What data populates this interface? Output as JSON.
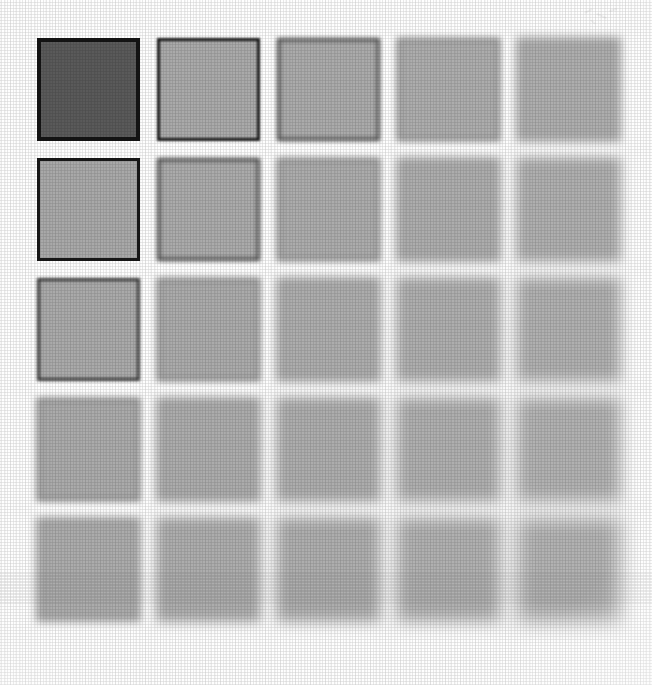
{
  "figure": {
    "background_color": "#fefefe",
    "image_width": 652,
    "image_height": 685,
    "rows": 5,
    "columns": 5,
    "cell_size": 103,
    "column_pitch": 120,
    "row_pitch": 120,
    "origin_x": 37,
    "origin_y": 38,
    "gap": 17,
    "border_color": "#1a1a1a",
    "dark_fill": "#5a5a5a",
    "light_fill": "#aaaaaa"
  },
  "chart_data": {
    "type": "heatmap",
    "xlabel": "Column",
    "ylabel": "Row",
    "categories_x": [
      "1",
      "2",
      "3",
      "4",
      "5"
    ],
    "categories_y": [
      "1",
      "2",
      "3",
      "4",
      "5"
    ],
    "grid": false,
    "legend": "none",
    "value_name": "blur_radius_px",
    "series": [
      {
        "name": "Row 1",
        "values": [
          0.0,
          0.8,
          2.0,
          3.4,
          4.6
        ]
      },
      {
        "name": "Row 2",
        "values": [
          0.6,
          2.0,
          3.4,
          4.6,
          5.8
        ]
      },
      {
        "name": "Row 3",
        "values": [
          1.8,
          3.2,
          4.6,
          5.8,
          7.0
        ]
      },
      {
        "name": "Row 4",
        "values": [
          3.2,
          4.6,
          5.8,
          7.0,
          8.2
        ]
      },
      {
        "name": "Row 5",
        "values": [
          4.4,
          5.8,
          7.0,
          8.2,
          9.4
        ]
      }
    ],
    "fill_series": [
      {
        "name": "Row 1",
        "values": [
          "#5a5a5a",
          "#aaaaaa",
          "#ababab",
          "#adadad",
          "#aeaeae"
        ]
      },
      {
        "name": "Row 2",
        "values": [
          "#a9a9a9",
          "#ababab",
          "#acacac",
          "#adadad",
          "#afafaf"
        ]
      },
      {
        "name": "Row 3",
        "values": [
          "#aaaaaa",
          "#ababab",
          "#adadad",
          "#aeaeae",
          "#b0b0b0"
        ]
      },
      {
        "name": "Row 4",
        "values": [
          "#ababab",
          "#acacac",
          "#adadad",
          "#afafaf",
          "#b1b1b1"
        ]
      },
      {
        "name": "Row 5",
        "values": [
          "#acacac",
          "#adadad",
          "#aeaeae",
          "#b0b0b0",
          "#b2b2b2"
        ]
      }
    ],
    "border_opacity_series": [
      {
        "name": "Row 1",
        "values": [
          1.0,
          0.96,
          0.72,
          0.5,
          0.38
        ]
      },
      {
        "name": "Row 2",
        "values": [
          0.97,
          0.74,
          0.52,
          0.39,
          0.3
        ]
      },
      {
        "name": "Row 3",
        "values": [
          0.76,
          0.54,
          0.4,
          0.31,
          0.24
        ]
      },
      {
        "name": "Row 4",
        "values": [
          0.55,
          0.41,
          0.32,
          0.25,
          0.19
        ]
      },
      {
        "name": "Row 5",
        "values": [
          0.42,
          0.33,
          0.26,
          0.2,
          0.15
        ]
      }
    ],
    "border_width_series": [
      {
        "name": "Row 1",
        "values": [
          4.0,
          3.6,
          3.0,
          2.6,
          2.4
        ]
      },
      {
        "name": "Row 2",
        "values": [
          3.6,
          3.0,
          2.6,
          2.4,
          2.2
        ]
      },
      {
        "name": "Row 3",
        "values": [
          3.0,
          2.6,
          2.4,
          2.2,
          2.0
        ]
      },
      {
        "name": "Row 4",
        "values": [
          2.6,
          2.4,
          2.2,
          2.0,
          2.0
        ]
      },
      {
        "name": "Row 5",
        "values": [
          2.4,
          2.2,
          2.0,
          2.0,
          2.0
        ]
      }
    ]
  },
  "cells": [
    {
      "id": "cell-r1c1",
      "row": 1,
      "col": 1,
      "fill": "#5a5a5a",
      "blur": 0.0,
      "border_opacity": 1.0,
      "border_width": 4.0
    },
    {
      "id": "cell-r1c2",
      "row": 1,
      "col": 2,
      "fill": "#aaaaaa",
      "blur": 0.8,
      "border_opacity": 0.96,
      "border_width": 3.6
    },
    {
      "id": "cell-r1c3",
      "row": 1,
      "col": 3,
      "fill": "#ababab",
      "blur": 2.0,
      "border_opacity": 0.72,
      "border_width": 3.0
    },
    {
      "id": "cell-r1c4",
      "row": 1,
      "col": 4,
      "fill": "#adadad",
      "blur": 3.4,
      "border_opacity": 0.5,
      "border_width": 2.6
    },
    {
      "id": "cell-r1c5",
      "row": 1,
      "col": 5,
      "fill": "#aeaeae",
      "blur": 4.6,
      "border_opacity": 0.38,
      "border_width": 2.4
    },
    {
      "id": "cell-r2c1",
      "row": 2,
      "col": 1,
      "fill": "#a9a9a9",
      "blur": 0.6,
      "border_opacity": 0.97,
      "border_width": 3.6
    },
    {
      "id": "cell-r2c2",
      "row": 2,
      "col": 2,
      "fill": "#ababab",
      "blur": 2.0,
      "border_opacity": 0.74,
      "border_width": 3.0
    },
    {
      "id": "cell-r2c3",
      "row": 2,
      "col": 3,
      "fill": "#acacac",
      "blur": 3.4,
      "border_opacity": 0.52,
      "border_width": 2.6
    },
    {
      "id": "cell-r2c4",
      "row": 2,
      "col": 4,
      "fill": "#adadad",
      "blur": 4.6,
      "border_opacity": 0.39,
      "border_width": 2.4
    },
    {
      "id": "cell-r2c5",
      "row": 2,
      "col": 5,
      "fill": "#afafaf",
      "blur": 5.8,
      "border_opacity": 0.3,
      "border_width": 2.2
    },
    {
      "id": "cell-r3c1",
      "row": 3,
      "col": 1,
      "fill": "#aaaaaa",
      "blur": 1.8,
      "border_opacity": 0.76,
      "border_width": 3.0
    },
    {
      "id": "cell-r3c2",
      "row": 3,
      "col": 2,
      "fill": "#ababab",
      "blur": 3.2,
      "border_opacity": 0.54,
      "border_width": 2.6
    },
    {
      "id": "cell-r3c3",
      "row": 3,
      "col": 3,
      "fill": "#adadad",
      "blur": 4.6,
      "border_opacity": 0.4,
      "border_width": 2.4
    },
    {
      "id": "cell-r3c4",
      "row": 3,
      "col": 4,
      "fill": "#aeaeae",
      "blur": 5.8,
      "border_opacity": 0.31,
      "border_width": 2.2
    },
    {
      "id": "cell-r3c5",
      "row": 3,
      "col": 5,
      "fill": "#b0b0b0",
      "blur": 7.0,
      "border_opacity": 0.24,
      "border_width": 2.0
    },
    {
      "id": "cell-r4c1",
      "row": 4,
      "col": 1,
      "fill": "#ababab",
      "blur": 3.2,
      "border_opacity": 0.55,
      "border_width": 2.6
    },
    {
      "id": "cell-r4c2",
      "row": 4,
      "col": 2,
      "fill": "#acacac",
      "blur": 4.6,
      "border_opacity": 0.41,
      "border_width": 2.4
    },
    {
      "id": "cell-r4c3",
      "row": 4,
      "col": 3,
      "fill": "#adadad",
      "blur": 5.8,
      "border_opacity": 0.32,
      "border_width": 2.2
    },
    {
      "id": "cell-r4c4",
      "row": 4,
      "col": 4,
      "fill": "#afafaf",
      "blur": 7.0,
      "border_opacity": 0.25,
      "border_width": 2.0
    },
    {
      "id": "cell-r4c5",
      "row": 4,
      "col": 5,
      "fill": "#b1b1b1",
      "blur": 8.2,
      "border_opacity": 0.19,
      "border_width": 2.0
    },
    {
      "id": "cell-r5c1",
      "row": 5,
      "col": 1,
      "fill": "#acacac",
      "blur": 4.4,
      "border_opacity": 0.42,
      "border_width": 2.4
    },
    {
      "id": "cell-r5c2",
      "row": 5,
      "col": 2,
      "fill": "#adadad",
      "blur": 5.8,
      "border_opacity": 0.33,
      "border_width": 2.2
    },
    {
      "id": "cell-r5c3",
      "row": 5,
      "col": 3,
      "fill": "#aeaeae",
      "blur": 7.0,
      "border_opacity": 0.26,
      "border_width": 2.0
    },
    {
      "id": "cell-r5c4",
      "row": 5,
      "col": 4,
      "fill": "#b0b0b0",
      "blur": 8.2,
      "border_opacity": 0.2,
      "border_width": 2.0
    },
    {
      "id": "cell-r5c5",
      "row": 5,
      "col": 5,
      "fill": "#b2b2b2",
      "blur": 9.4,
      "border_opacity": 0.15,
      "border_width": 2.0
    }
  ]
}
